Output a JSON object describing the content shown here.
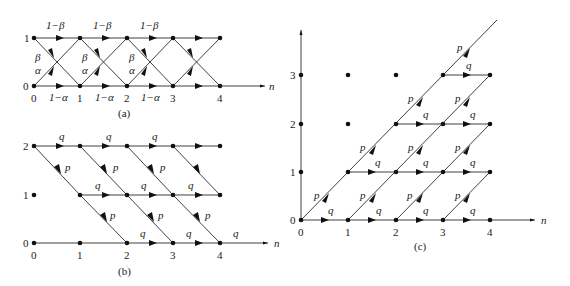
{
  "figure": {
    "panels": [
      {
        "id": "a",
        "caption": "(a)",
        "axis_label": "n",
        "state_labels": [
          "0",
          "1"
        ],
        "time_labels": [
          "0",
          "1",
          "2",
          "3",
          "4"
        ],
        "edges": {
          "stay_top": "1−β",
          "stay_bottom": "1−α",
          "down": "β",
          "up": "α"
        },
        "top_labels": [
          "1−β",
          "1−β",
          "1−β"
        ],
        "bottom_labels": [
          "1−α",
          "1−α",
          "1−α"
        ],
        "down_labels": [
          "β",
          "β",
          "β"
        ],
        "up_labels": [
          "α",
          "α",
          "α"
        ]
      },
      {
        "id": "b",
        "caption": "(b)",
        "axis_label": "n",
        "state_labels": [
          "0",
          "1",
          "2"
        ],
        "time_labels": [
          "0",
          "1",
          "2",
          "3",
          "4"
        ],
        "edges": {
          "horizontal": "q",
          "diagonal": "p"
        },
        "row2_labels": [
          "q",
          "q",
          "q"
        ],
        "row1_labels": [
          "q",
          "q",
          "q"
        ],
        "row0_labels": [
          "q",
          "q",
          "q"
        ],
        "diag_upper_labels": [
          "p",
          "p",
          "p"
        ],
        "diag_lower_labels": [
          "p",
          "p",
          "p"
        ]
      },
      {
        "id": "c",
        "caption": "(c)",
        "axis_label": "n",
        "state_labels": [
          "0",
          "1",
          "2",
          "3"
        ],
        "time_labels": [
          "0",
          "1",
          "2",
          "3",
          "4"
        ],
        "edges": {
          "horizontal": "q",
          "diagonal": "p"
        },
        "q_label": "q",
        "p_label": "p"
      }
    ]
  }
}
